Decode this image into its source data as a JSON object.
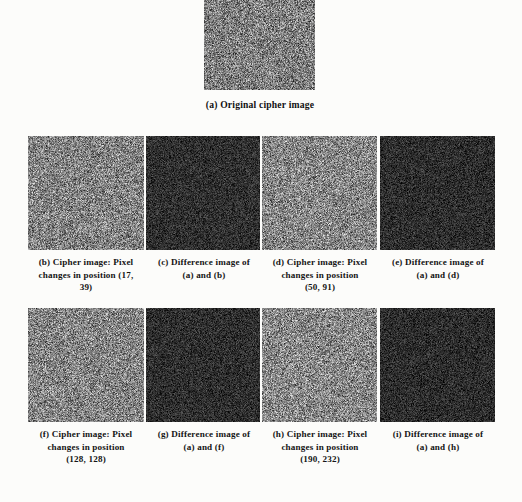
{
  "figure": {
    "background_color": "#fcfcfa",
    "caption_color": "#141414",
    "panels": [
      {
        "id": "a",
        "kind": "cipher",
        "caption_lines": [
          "(a) Original cipher image"
        ],
        "mean_gray": 128,
        "x": 204,
        "y": 0,
        "w": 111,
        "h": 90
      },
      {
        "id": "b",
        "kind": "cipher",
        "caption_lines": [
          "(b) Cipher image: Pixel",
          "changes in position (17,",
          "39)"
        ],
        "position_label": "(17, 39)",
        "mean_gray": 132,
        "x": 28,
        "y": 136,
        "w": 116,
        "h": 114
      },
      {
        "id": "c",
        "kind": "difference",
        "caption_lines": [
          "(c) Difference image of",
          "(a) and (b)"
        ],
        "mean_gray": 48,
        "x": 146,
        "y": 136,
        "w": 114,
        "h": 114
      },
      {
        "id": "d",
        "kind": "cipher",
        "caption_lines": [
          "(d) Cipher image: Pixel",
          "changes in position",
          "(50, 91)"
        ],
        "position_label": "(50, 91)",
        "mean_gray": 135,
        "x": 262,
        "y": 136,
        "w": 115,
        "h": 114
      },
      {
        "id": "e",
        "kind": "difference",
        "caption_lines": [
          "(e) Difference image of",
          "(a) and (d)"
        ],
        "mean_gray": 46,
        "x": 380,
        "y": 136,
        "w": 115,
        "h": 114
      },
      {
        "id": "f",
        "kind": "cipher",
        "caption_lines": [
          "(f) Cipher image: Pixel",
          "changes in position",
          "(128, 128)"
        ],
        "position_label": "(128, 128)",
        "mean_gray": 133,
        "x": 28,
        "y": 308,
        "w": 116,
        "h": 114
      },
      {
        "id": "g",
        "kind": "difference",
        "caption_lines": [
          "(g) Difference image of",
          "(a) and (f)"
        ],
        "mean_gray": 47,
        "x": 146,
        "y": 308,
        "w": 114,
        "h": 114
      },
      {
        "id": "h",
        "kind": "cipher",
        "caption_lines": [
          "(h) Cipher image: Pixel",
          "changes in position",
          "(190, 232)"
        ],
        "position_label": "(190, 232)",
        "mean_gray": 136,
        "x": 262,
        "y": 308,
        "w": 115,
        "h": 114
      },
      {
        "id": "i",
        "kind": "difference",
        "caption_lines": [
          "(i) Difference image of",
          "(a) and (h)"
        ],
        "mean_gray": 45,
        "x": 380,
        "y": 308,
        "w": 115,
        "h": 114
      }
    ]
  }
}
